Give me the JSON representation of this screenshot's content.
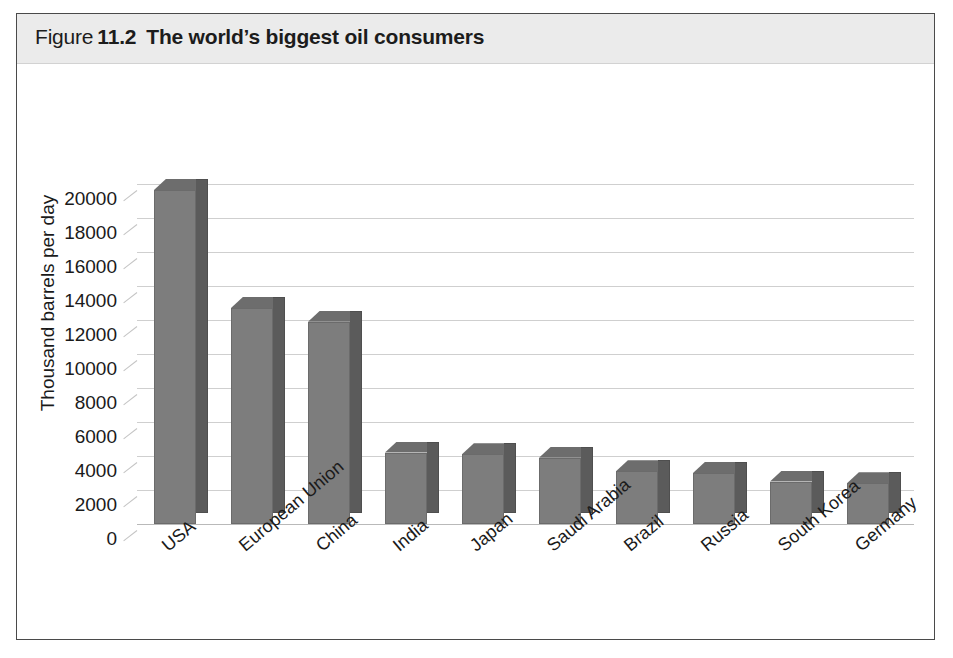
{
  "figure": {
    "label_word": "Figure",
    "number": "11.2",
    "title": "The world’s biggest oil consumers"
  },
  "chart_data": {
    "type": "bar",
    "title": "The world’s biggest oil consumers",
    "xlabel": "",
    "ylabel": "Thousand barrels per day",
    "ylim": [
      0,
      20000
    ],
    "ytick_step": 2000,
    "yticks": [
      "20000",
      "18000",
      "16000",
      "14000",
      "12000",
      "10000",
      "8000",
      "6000",
      "4000",
      "2000",
      "0"
    ],
    "grid": true,
    "legend": "none",
    "style": "3d-column",
    "bar_color": "#7d7d7d",
    "bar_side_color": "#5b5b5b",
    "bar_top_color": "#6d6d6d",
    "gridline_color": "#cfcfcf",
    "categories": [
      "USA",
      "European Union",
      "China",
      "India",
      "Japan",
      "Saudi Arabia",
      "Brazil",
      "Russia",
      "South Korea",
      "Germany"
    ],
    "values": [
      19650,
      12700,
      11900,
      4200,
      4100,
      3900,
      3100,
      3000,
      2500,
      2400
    ]
  }
}
